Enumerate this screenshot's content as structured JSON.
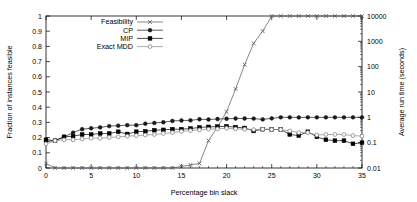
{
  "chart_data": {
    "type": "line",
    "title": "",
    "xlabel": "Percentage bin slack",
    "ylabel": "Fraction of instances feasible",
    "y2label": "Average run time (seconds)",
    "xlim": [
      0,
      35
    ],
    "ylim": [
      0,
      1
    ],
    "y2lim": [
      0.01,
      10000
    ],
    "y2scale": "log",
    "grid": false,
    "legend_position": "top-left",
    "xticks": [
      0,
      5,
      10,
      15,
      20,
      25,
      30,
      35
    ],
    "xtick_labels": [
      "0",
      "5",
      "10",
      "15",
      "20",
      "25",
      "30",
      "35"
    ],
    "yticks": [
      0,
      0.1,
      0.2,
      0.3,
      0.4,
      0.5,
      0.6,
      0.7,
      0.8,
      0.9,
      1
    ],
    "ytick_labels": [
      "0",
      "0.1",
      "0.2",
      "0.3",
      "0.4",
      "0.5",
      "0.6",
      "0.7",
      "0.8",
      "0.9",
      "1"
    ],
    "y2ticks": [
      0.01,
      0.1,
      1,
      10,
      100,
      1000,
      10000
    ],
    "y2tick_labels": [
      "0.01",
      "0.1",
      "1",
      "10",
      "100",
      "1000",
      "10000"
    ],
    "series": [
      {
        "name": "Feasibility",
        "axis": "left",
        "marker": "cross",
        "color": "#555555",
        "x": [
          0,
          1,
          2,
          3,
          4,
          5,
          6,
          7,
          8,
          9,
          10,
          11,
          12,
          13,
          14,
          15,
          16,
          17,
          18,
          19,
          20,
          21,
          22,
          23,
          24,
          25,
          26,
          27,
          28,
          29,
          30,
          31,
          32,
          33,
          34,
          35
        ],
        "y": [
          0.03,
          0.0,
          0.0,
          0.0,
          0.0,
          0.0,
          0.0,
          0.0,
          0.0,
          0.0,
          0.0,
          0.0,
          0.0,
          0.0,
          0.0,
          0.01,
          0.02,
          0.03,
          0.18,
          0.27,
          0.37,
          0.52,
          0.68,
          0.82,
          0.9,
          1.0,
          1.0,
          1.0,
          1.0,
          1.0,
          1.0,
          1.0,
          1.0,
          1.0,
          1.0,
          1.0
        ]
      },
      {
        "name": "CP",
        "axis": "right",
        "marker": "dot",
        "color": "#1a1a1a",
        "x": [
          0,
          1,
          2,
          3,
          4,
          5,
          6,
          7,
          8,
          9,
          10,
          11,
          12,
          13,
          14,
          15,
          16,
          17,
          18,
          19,
          20,
          21,
          22,
          23,
          24,
          25,
          26,
          27,
          28,
          29,
          30,
          31,
          32,
          33,
          34,
          35
        ],
        "y": [
          0.11,
          0.12,
          0.17,
          0.25,
          0.34,
          0.37,
          0.4,
          0.45,
          0.47,
          0.49,
          0.49,
          0.56,
          0.6,
          0.64,
          0.72,
          0.75,
          0.76,
          0.84,
          0.82,
          0.86,
          0.88,
          0.9,
          0.9,
          0.89,
          0.83,
          0.91,
          1.0,
          1.0,
          0.99,
          1.0,
          1.0,
          1.0,
          1.0,
          1.0,
          1.0,
          1.0
        ]
      },
      {
        "name": "MIP",
        "axis": "right",
        "marker": "square",
        "color": "#000000",
        "x": [
          0,
          1,
          2,
          3,
          4,
          5,
          6,
          7,
          8,
          9,
          10,
          11,
          12,
          13,
          14,
          15,
          16,
          17,
          18,
          19,
          20,
          21,
          22,
          23,
          24,
          25,
          26,
          27,
          28,
          29,
          30,
          31,
          32,
          33,
          34,
          35
        ],
        "y": [
          0.13,
          0.12,
          0.17,
          0.18,
          0.21,
          0.21,
          0.23,
          0.23,
          0.27,
          0.22,
          0.27,
          0.28,
          0.31,
          0.32,
          0.34,
          0.34,
          0.36,
          0.4,
          0.42,
          0.43,
          0.44,
          0.41,
          0.38,
          0.29,
          0.34,
          0.33,
          0.33,
          0.21,
          0.19,
          0.27,
          0.17,
          0.13,
          0.12,
          0.12,
          0.09,
          0.1
        ]
      },
      {
        "name": "Exact MDD",
        "axis": "right",
        "marker": "circle",
        "color": "#888888",
        "x": [
          0,
          1,
          2,
          3,
          4,
          5,
          6,
          7,
          8,
          9,
          10,
          11,
          12,
          13,
          14,
          15,
          16,
          17,
          18,
          19,
          20,
          21,
          22,
          23,
          24,
          25,
          26,
          27,
          28,
          29,
          30,
          31,
          32,
          33,
          34,
          35
        ],
        "y": [
          0.09,
          0.12,
          0.13,
          0.13,
          0.14,
          0.15,
          0.15,
          0.16,
          0.17,
          0.18,
          0.19,
          0.2,
          0.21,
          0.23,
          0.25,
          0.28,
          0.3,
          0.32,
          0.34,
          0.35,
          0.37,
          0.35,
          0.34,
          0.33,
          0.34,
          0.33,
          0.33,
          0.29,
          0.25,
          0.25,
          0.2,
          0.21,
          0.21,
          0.21,
          0.19,
          0.18
        ]
      }
    ],
    "legend_entries": [
      {
        "label": "Feasibility",
        "marker": "cross",
        "color": "#555555"
      },
      {
        "label": "CP",
        "marker": "dot",
        "color": "#1a1a1a"
      },
      {
        "label": "MIP",
        "marker": "square",
        "color": "#000000"
      },
      {
        "label": "Exact MDD",
        "marker": "circle",
        "color": "#888888"
      }
    ]
  }
}
